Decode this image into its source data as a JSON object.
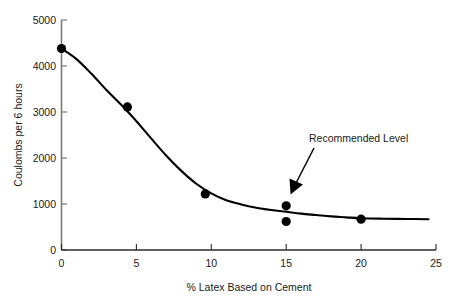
{
  "chart_data": {
    "type": "scatter",
    "title": "",
    "subtitle": "",
    "xlabel": "% Latex Based on Cement",
    "ylabel": "Coulombs per 6 hours",
    "xlim": [
      0,
      25
    ],
    "ylim": [
      0,
      5000
    ],
    "xticks": [
      0,
      5,
      10,
      15,
      20,
      25
    ],
    "xtick_labels": [
      "0",
      "5",
      "10",
      "15",
      "20",
      "25"
    ],
    "yticks": [
      0,
      1000,
      2000,
      3000,
      4000,
      5000
    ],
    "ytick_labels": [
      "0",
      "1000",
      "2000",
      "3000",
      "4000",
      "5000"
    ],
    "grid": false,
    "legend": false,
    "legend_position": "none",
    "series": [
      {
        "name": "Measured points",
        "marker": "filled-circle",
        "color": "#000000",
        "points": [
          {
            "x": 0.0,
            "y": 4380
          },
          {
            "x": 4.4,
            "y": 3110
          },
          {
            "x": 9.6,
            "y": 1220
          },
          {
            "x": 15.0,
            "y": 960
          },
          {
            "x": 15.0,
            "y": 620
          },
          {
            "x": 20.0,
            "y": 670
          }
        ]
      },
      {
        "name": "Fitted trend curve",
        "marker": "none",
        "style": "solid-line",
        "color": "#000000",
        "points": [
          {
            "x": 0.0,
            "y": 4380
          },
          {
            "x": 1.0,
            "y": 4150
          },
          {
            "x": 2.0,
            "y": 3830
          },
          {
            "x": 3.0,
            "y": 3480
          },
          {
            "x": 4.0,
            "y": 3150
          },
          {
            "x": 5.0,
            "y": 2800
          },
          {
            "x": 6.0,
            "y": 2420
          },
          {
            "x": 7.0,
            "y": 2050
          },
          {
            "x": 8.0,
            "y": 1720
          },
          {
            "x": 9.0,
            "y": 1440
          },
          {
            "x": 10.0,
            "y": 1230
          },
          {
            "x": 11.0,
            "y": 1080
          },
          {
            "x": 12.0,
            "y": 990
          },
          {
            "x": 13.0,
            "y": 920
          },
          {
            "x": 14.0,
            "y": 870
          },
          {
            "x": 15.0,
            "y": 830
          },
          {
            "x": 16.0,
            "y": 790
          },
          {
            "x": 17.0,
            "y": 760
          },
          {
            "x": 18.0,
            "y": 730
          },
          {
            "x": 19.0,
            "y": 710
          },
          {
            "x": 20.0,
            "y": 690
          },
          {
            "x": 21.5,
            "y": 680
          },
          {
            "x": 23.0,
            "y": 675
          },
          {
            "x": 24.5,
            "y": 670
          }
        ]
      }
    ],
    "annotations": [
      {
        "text": "Recommended Level",
        "target_x": 15.0,
        "target_y": 1100,
        "arrow": true
      }
    ]
  }
}
